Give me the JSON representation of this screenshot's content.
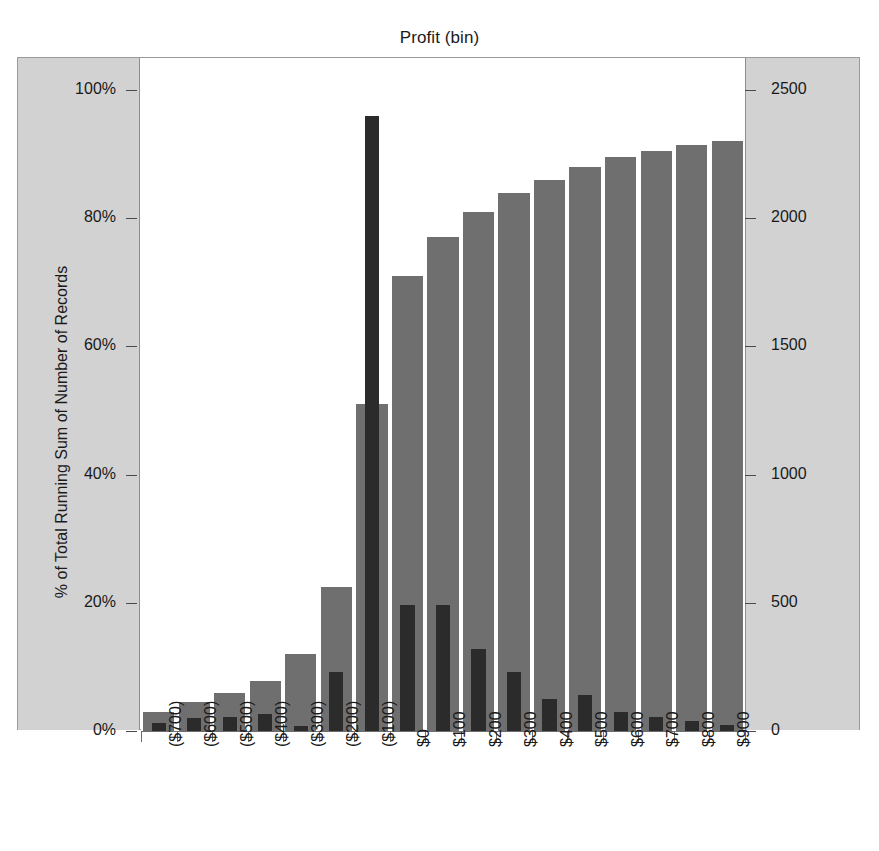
{
  "chart_data": {
    "type": "bar",
    "title": "Profit (bin)",
    "xlabel": "",
    "ylabel": "% of Total Running Sum of Number of Records",
    "y2label": "Number of Records",
    "grid": false,
    "legend": "none",
    "ylim": [
      0,
      100
    ],
    "y2lim": [
      0,
      2500
    ],
    "ytick_labels": [
      "100%",
      "80%",
      "60%",
      "40%",
      "20%",
      "0%"
    ],
    "ytick_values": [
      100,
      80,
      60,
      40,
      20,
      0
    ],
    "y2tick_labels": [
      "2500",
      "2000",
      "1500",
      "1000",
      "500",
      "0"
    ],
    "y2tick_values": [
      2500,
      2000,
      1500,
      1000,
      500,
      0
    ],
    "categories": [
      "($700)",
      "($600)",
      "($500)",
      "($400)",
      "($300)",
      "($200)",
      "($100)",
      "$0",
      "$100",
      "$200",
      "$300",
      "$400",
      "$500",
      "$600",
      "$700",
      "$800",
      "$900"
    ],
    "series": [
      {
        "name": "% of Total Running Sum of Number of Records",
        "axis": "left",
        "color": "#6f6f6f",
        "values": [
          3.0,
          4.5,
          6.0,
          7.8,
          12.0,
          22.5,
          51.0,
          71.0,
          77.0,
          81.0,
          84.0,
          86.0,
          88.0,
          89.5,
          90.5,
          91.5,
          92.0
        ]
      },
      {
        "name": "Number of Records",
        "axis": "right",
        "color": "#2b2b2b",
        "values": [
          30,
          50,
          55,
          65,
          20,
          230,
          2400,
          490,
          490,
          320,
          230,
          125,
          140,
          75,
          55,
          40,
          25
        ]
      }
    ]
  },
  "colors": {
    "series_pct": "#6f6f6f",
    "series_count": "#2b2b2b",
    "axis_band": "#d2d2d2",
    "frame": "#9a9a9a",
    "text": "#1a1a1a",
    "plot_background": "#ffffff"
  }
}
